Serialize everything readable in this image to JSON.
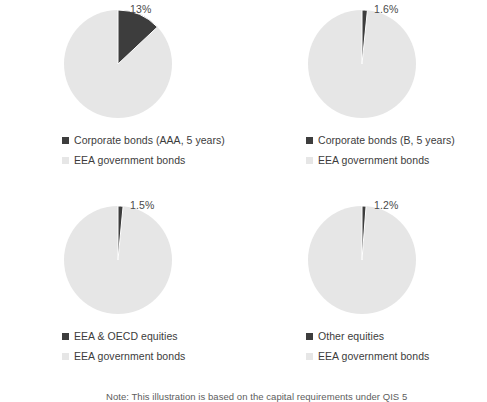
{
  "chart_data": [
    {
      "type": "pie",
      "title": "",
      "categories": [
        "Corporate bonds (AAA, 5 years)",
        "EEA government bonds"
      ],
      "values": [
        13,
        87
      ],
      "data_label": "13%",
      "legend_position": "bottom",
      "colors": [
        "#3d3d3d",
        "#e6e6e6"
      ]
    },
    {
      "type": "pie",
      "title": "",
      "categories": [
        "Corporate bonds (B, 5 years)",
        "EEA government bonds"
      ],
      "values": [
        1.6,
        98.4
      ],
      "data_label": "1.6%",
      "legend_position": "bottom",
      "colors": [
        "#3d3d3d",
        "#e6e6e6"
      ]
    },
    {
      "type": "pie",
      "title": "",
      "categories": [
        "EEA & OECD equities",
        "EEA government bonds"
      ],
      "values": [
        1.5,
        98.5
      ],
      "data_label": "1.5%",
      "legend_position": "bottom",
      "colors": [
        "#3d3d3d",
        "#e6e6e6"
      ]
    },
    {
      "type": "pie",
      "title": "",
      "categories": [
        "Other equities",
        "EEA government bonds"
      ],
      "values": [
        1.2,
        98.8
      ],
      "data_label": "1.2%",
      "legend_position": "bottom",
      "colors": [
        "#3d3d3d",
        "#e6e6e6"
      ]
    }
  ],
  "panels": [
    {
      "data_label": "13%",
      "slice_pct": 13,
      "legend": [
        {
          "label": "Corporate bonds (AAA, 5 years)",
          "color": "#3d3d3d"
        },
        {
          "label": "EEA government bonds",
          "color": "#e6e6e6"
        }
      ]
    },
    {
      "data_label": "1.6%",
      "slice_pct": 1.6,
      "legend": [
        {
          "label": "Corporate bonds (B, 5 years)",
          "color": "#3d3d3d"
        },
        {
          "label": "EEA government bonds",
          "color": "#e6e6e6"
        }
      ]
    },
    {
      "data_label": "1.5%",
      "slice_pct": 1.5,
      "legend": [
        {
          "label": "EEA & OECD equities",
          "color": "#3d3d3d"
        },
        {
          "label": "EEA government bonds",
          "color": "#e6e6e6"
        }
      ]
    },
    {
      "data_label": "1.2%",
      "slice_pct": 1.2,
      "legend": [
        {
          "label": "Other equities",
          "color": "#3d3d3d"
        },
        {
          "label": "EEA government bonds",
          "color": "#e6e6e6"
        }
      ]
    }
  ],
  "footnote": {
    "text": "Note: This illustration is based on the capital requirements under QIS 5"
  },
  "colors": {
    "dark_slice": "#3d3d3d",
    "light_slice": "#e6e6e6",
    "background": "#ffffff",
    "text": "#3c3c3c"
  }
}
